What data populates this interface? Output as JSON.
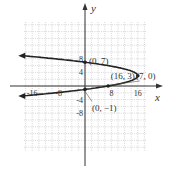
{
  "chart_data": {
    "type": "line",
    "title": "",
    "xlabel": "x",
    "ylabel": "y",
    "xlim": [
      -18,
      18
    ],
    "ylim": [
      -10,
      10
    ],
    "grid": true,
    "x_ticks": [
      "-16",
      "-8",
      "8",
      "16"
    ],
    "y_ticks": [
      "8",
      "4",
      "-4",
      "-8"
    ],
    "series": [
      {
        "name": "x = -(y - 3)^2 + 16",
        "equation": "x = -(y-3)^2 + 16",
        "points": [
          [
            -20,
            10.6
          ],
          [
            0,
            7
          ],
          [
            7,
            6
          ],
          [
            15,
            4
          ],
          [
            16,
            3
          ],
          [
            15,
            2
          ],
          [
            7,
            0
          ],
          [
            0,
            -1
          ],
          [
            -20,
            -3.6
          ]
        ]
      }
    ],
    "annotations": [
      {
        "label": "(0, 7)",
        "x": 0,
        "y": 7
      },
      {
        "label": "(16, 3)",
        "x": 16,
        "y": 3
      },
      {
        "label": "(7, 0)",
        "x": 7,
        "y": 0
      },
      {
        "label": "(0, −1)",
        "x": 0,
        "y": -1
      }
    ]
  }
}
